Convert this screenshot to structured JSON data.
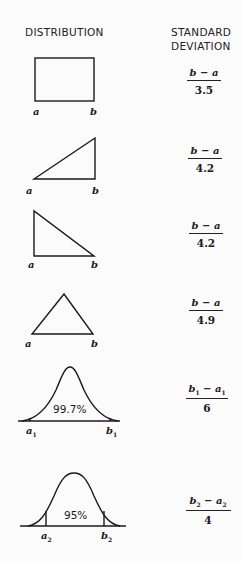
{
  "headers": {
    "distribution": "DISTRIBUTION",
    "std_dev_line1": "STANDARD",
    "std_dev_line2": "DEVIATION"
  },
  "rows": [
    {
      "shape": "uniform-rectangle",
      "left_label": "a",
      "right_label": "b",
      "formula_num": "b − a",
      "formula_den": "3.5"
    },
    {
      "shape": "right-triangle-ascending",
      "left_label": "a",
      "right_label": "b",
      "formula_num": "b − a",
      "formula_den": "4.2"
    },
    {
      "shape": "right-triangle-descending",
      "left_label": "a",
      "right_label": "b",
      "formula_num": "b − a",
      "formula_den": "4.2"
    },
    {
      "shape": "isosceles-triangle",
      "left_label": "a",
      "right_label": "b",
      "formula_num": "b − a",
      "formula_den": "4.9"
    },
    {
      "shape": "normal-curve-99.7",
      "center_label": "99.7%",
      "left_label": "a",
      "left_sub": "1",
      "right_label": "b",
      "right_sub": "1",
      "formula_num_b": "b",
      "formula_num_b_sub": "1",
      "formula_num_mid": " − ",
      "formula_num_a": "a",
      "formula_num_a_sub": "1",
      "formula_den": "6"
    },
    {
      "shape": "normal-curve-95",
      "center_label": "95%",
      "left_label": "a",
      "left_sub": "2",
      "right_label": "b",
      "right_sub": "2",
      "formula_num_b": "b",
      "formula_num_b_sub": "2",
      "formula_num_mid": " − ",
      "formula_num_a": "a",
      "formula_num_a_sub": "2",
      "formula_den": "4"
    }
  ]
}
